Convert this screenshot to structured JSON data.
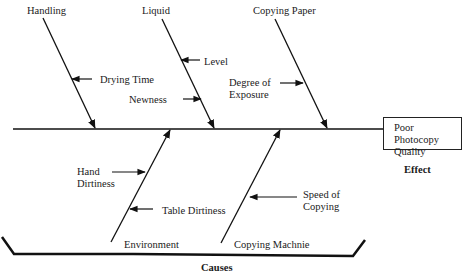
{
  "diagram": {
    "type": "fishbone",
    "effect": {
      "box_text": "Poor Photocopy\nQuality",
      "caption": "Effect"
    },
    "causes_caption": "Causes",
    "categories": [
      {
        "label": "Handling",
        "position": "top",
        "causes": [
          "Drying Time"
        ]
      },
      {
        "label": "Liquid",
        "position": "top",
        "causes": [
          "Level",
          "Newness"
        ]
      },
      {
        "label": "Copying Paper",
        "position": "top",
        "causes": [
          "Degree of\nExposure"
        ]
      },
      {
        "label": "Environment",
        "position": "bottom",
        "causes": [
          "Hand\nDirtiness",
          "Table Dirtiness"
        ]
      },
      {
        "label": "Copying Machnie",
        "position": "bottom",
        "causes": [
          "Speed of\nCopying"
        ]
      }
    ]
  }
}
